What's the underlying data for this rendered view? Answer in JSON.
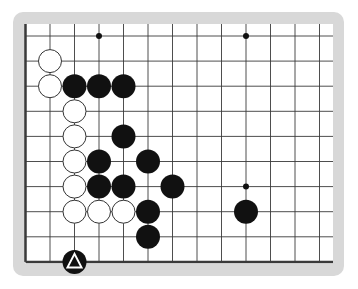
{
  "board": {
    "title": "Go board diagram (corner section)",
    "colors": {
      "frame": "#d8d8d8",
      "board": "#ffffff",
      "line": "#3a3a3a",
      "black_stone": "#111111",
      "white_stone": "#ffffff"
    },
    "grid": {
      "origin_x": 25.5,
      "origin_y": 36,
      "spacing_x": 24.5,
      "spacing_y": 25.1,
      "columns": 13,
      "rows": 10,
      "edges": [
        "left",
        "bottom"
      ]
    },
    "star_points": [
      {
        "col": 3,
        "row": 0
      },
      {
        "col": 9,
        "row": 0
      },
      {
        "col": 9,
        "row": 6
      }
    ],
    "stones": [
      {
        "color": "white",
        "col": 1,
        "row": 1
      },
      {
        "color": "white",
        "col": 1,
        "row": 2
      },
      {
        "color": "black",
        "col": 2,
        "row": 2
      },
      {
        "color": "black",
        "col": 3,
        "row": 2
      },
      {
        "color": "black",
        "col": 4,
        "row": 2
      },
      {
        "color": "white",
        "col": 2,
        "row": 3
      },
      {
        "color": "white",
        "col": 2,
        "row": 4
      },
      {
        "color": "black",
        "col": 4,
        "row": 4
      },
      {
        "color": "white",
        "col": 2,
        "row": 5
      },
      {
        "color": "black",
        "col": 3,
        "row": 5
      },
      {
        "color": "black",
        "col": 5,
        "row": 5
      },
      {
        "color": "white",
        "col": 2,
        "row": 6
      },
      {
        "color": "black",
        "col": 3,
        "row": 6
      },
      {
        "color": "black",
        "col": 4,
        "row": 6
      },
      {
        "color": "black",
        "col": 6,
        "row": 6
      },
      {
        "color": "white",
        "col": 2,
        "row": 7
      },
      {
        "color": "white",
        "col": 3,
        "row": 7
      },
      {
        "color": "white",
        "col": 4,
        "row": 7
      },
      {
        "color": "black",
        "col": 5,
        "row": 7
      },
      {
        "color": "black",
        "col": 9,
        "row": 7
      },
      {
        "color": "black",
        "col": 5,
        "row": 8
      },
      {
        "color": "black",
        "col": 2,
        "row": 9,
        "marker": "triangle-icon"
      }
    ]
  }
}
